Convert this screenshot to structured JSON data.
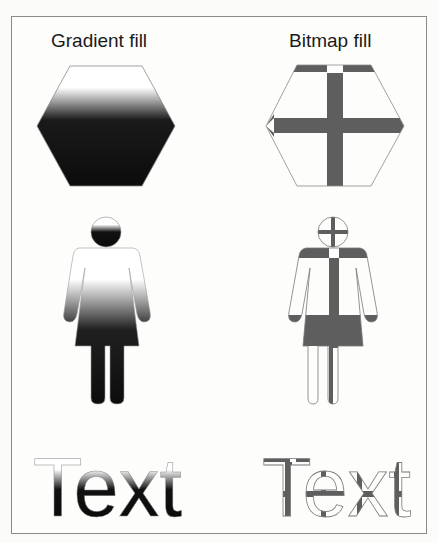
{
  "panels": [
    {
      "id": "gradient",
      "caption": "Gradient fill",
      "sample_text": "Text"
    },
    {
      "id": "bitmap",
      "caption": "Bitmap fill",
      "sample_text": "Text"
    }
  ],
  "colors": {
    "gradient_dark": "#0c0c0c",
    "gradient_light": "#ffffff",
    "bitmap_bar": "#5a5a5a",
    "outline": "#7a7a7a",
    "frame": "#8a8a8a"
  }
}
